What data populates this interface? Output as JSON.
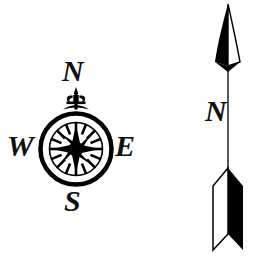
{
  "image": {
    "title": "Compass rose and north arrow",
    "background_color": "#ffffff",
    "ink_color": "#000000",
    "width": 261,
    "height": 258
  },
  "compass_rose": {
    "name": "compass-rose",
    "center": {
      "x": 76,
      "y": 149
    },
    "outer_radius": 37,
    "ornament": "fleur-de-lis",
    "star_points": 8,
    "ring_ticks": 16,
    "labels": {
      "north": "N",
      "west": "W",
      "east": "E",
      "south": "S"
    }
  },
  "north_arrow": {
    "name": "north-arrow",
    "label": "N",
    "tip": {
      "x": 228,
      "y": 4
    },
    "tail": {
      "x": 228,
      "y": 250
    },
    "style": "half-filled spear with fletching"
  }
}
